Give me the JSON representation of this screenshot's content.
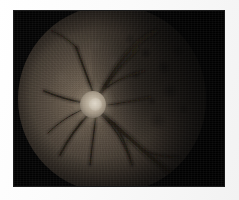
{
  "document": {
    "type": "medical-image",
    "modality": "fundus photograph",
    "caption": "",
    "canvas": {
      "width": 239,
      "height": 200
    }
  },
  "mount": {
    "name": "photo-mount",
    "color": "#fdfdfd"
  },
  "plate": {
    "name": "photographic-plate",
    "background_color": "#050505",
    "left": 14,
    "top": 11,
    "width": 210,
    "height": 175
  },
  "fundus": {
    "label": "",
    "field_shape": "circle",
    "field_diameter": 188,
    "base_color": "#4a4036",
    "dark_periphery_color": "#060605",
    "illumination_center": "34% 50%"
  },
  "optic_disc": {
    "label": "",
    "center_x": 79,
    "center_y": 100,
    "diameter": 26,
    "rim_color": "#bdb2a0",
    "cup_color": "#ded6c8"
  },
  "mottled_region": {
    "label": "",
    "position": "temporal-right",
    "color": "#0a0908"
  },
  "vessels": {
    "label": "",
    "color": "#1c1712",
    "highlight_color": "#6a5f52",
    "paths": [
      {
        "name": "inferior-temporal-arcade",
        "d": "M 78 104 C 92 116, 108 130, 126 146 C 136 155, 146 163, 158 172",
        "width": 3.2
      },
      {
        "name": "inferior-temporal-arcade-branch",
        "d": "M 96 118 C 104 130, 110 144, 114 160",
        "width": 1.7
      },
      {
        "name": "superior-temporal-arcade",
        "d": "M 80 92 C 88 78, 96 64, 108 50 C 116 40, 126 32, 138 26",
        "width": 2.4
      },
      {
        "name": "superior-nasal-vessel",
        "d": "M 76 90 C 70 74, 64 58, 58 42",
        "width": 1.9
      },
      {
        "name": "superior-arch-upper",
        "d": "M 82 90 C 94 72, 104 58, 120 44",
        "width": 1.5
      },
      {
        "name": "nasal-vessel",
        "d": "M 68 98 C 54 96, 40 92, 26 86",
        "width": 1.8
      },
      {
        "name": "inferior-nasal-vessel",
        "d": "M 72 108 C 60 120, 50 134, 42 150",
        "width": 1.9
      },
      {
        "name": "inferior-vessel-mid",
        "d": "M 78 110 C 76 126, 74 142, 72 160",
        "width": 1.5
      },
      {
        "name": "temporal-fine-branch",
        "d": "M 90 100 C 104 98, 118 96, 132 92",
        "width": 1.2
      },
      {
        "name": "superior-fine-branch",
        "d": "M 84 86 C 96 76, 110 70, 126 66",
        "width": 1.1
      },
      {
        "name": "inferior-fine-branch",
        "d": "M 86 112 C 98 124, 106 138, 112 154",
        "width": 1.1
      },
      {
        "name": "nasal-fine-branch",
        "d": "M 66 104 C 52 110, 40 118, 30 128",
        "width": 1.0
      },
      {
        "name": "peripheral-branch-upper-left",
        "d": "M 60 44 C 52 36, 44 30, 34 26",
        "width": 1.0
      },
      {
        "name": "peripheral-branch-lower-right",
        "d": "M 126 146 C 136 150, 148 152, 162 152",
        "width": 1.2
      }
    ]
  }
}
